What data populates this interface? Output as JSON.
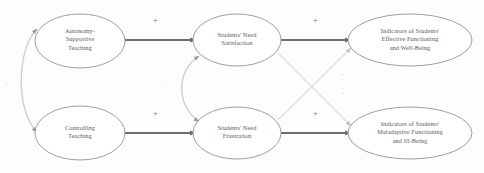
{
  "figure": {
    "type": "path-diagram",
    "background_color": "#fdfdfd",
    "node_stroke_color": "#8d8d8d",
    "node_fill_color": "#ffffff",
    "strong_arrow_color": "#6e6e6e",
    "faint_arrow_color": "#d6d6d6",
    "curved_arrow_color": "#c9c9c9",
    "text_color": "#5a5a5a"
  },
  "nodes": [
    {
      "id": "autonomy-supportive-teaching",
      "label": "Autonomy-\nSupportive\nTeaching",
      "cx": 80,
      "cy": 41,
      "rx": 45,
      "ry": 27
    },
    {
      "id": "controlling-teaching",
      "label": "Controlling\nTeaching",
      "cx": 80,
      "cy": 133,
      "rx": 45,
      "ry": 27
    },
    {
      "id": "students-need-satisfaction",
      "label": "Students' Need\nSatisfaction",
      "cx": 237,
      "cy": 40,
      "rx": 44,
      "ry": 26
    },
    {
      "id": "students-need-frustration",
      "label": "Students' Need\nFrustration",
      "cx": 237,
      "cy": 133,
      "rx": 44,
      "ry": 26
    },
    {
      "id": "indicators-effective-functioning",
      "label": "Indicators of Students'\nEffective Functioning\nand Well-Being",
      "cx": 410,
      "cy": 40,
      "rx": 62,
      "ry": 26
    },
    {
      "id": "indicators-maladaptive-functioning",
      "label": "Indicators of Students'\nMaladaptive Functioning\nand Ill-Being",
      "cx": 410,
      "cy": 133,
      "rx": 62,
      "ry": 26
    }
  ],
  "paths": [
    {
      "id": "autonomy-to-satisfaction",
      "from": "autonomy-supportive-teaching",
      "to": "students-need-satisfaction",
      "sign": "+",
      "style": "strong",
      "sign_x": 153,
      "sign_y": 18
    },
    {
      "id": "controlling-to-frustration",
      "from": "controlling-teaching",
      "to": "students-need-frustration",
      "sign": "+",
      "style": "strong",
      "sign_x": 153,
      "sign_y": 111
    },
    {
      "id": "satisfaction-to-effective",
      "from": "students-need-satisfaction",
      "to": "indicators-effective-functioning",
      "sign": "+",
      "style": "strong",
      "sign_x": 313,
      "sign_y": 18
    },
    {
      "id": "frustration-to-maladaptive",
      "from": "students-need-frustration",
      "to": "indicators-maladaptive-functioning",
      "sign": "+",
      "style": "strong",
      "sign_x": 313,
      "sign_y": 111
    },
    {
      "id": "satisfaction-to-maladaptive",
      "from": "students-need-satisfaction",
      "to": "indicators-maladaptive-functioning",
      "sign": "-",
      "style": "faint-diagonal",
      "sign_x": 341,
      "sign_y": 73
    },
    {
      "id": "frustration-to-effective",
      "from": "students-need-frustration",
      "to": "indicators-effective-functioning",
      "sign": "-",
      "style": "faint-diagonal",
      "sign_x": 342,
      "sign_y": 92
    },
    {
      "id": "teaching-styles-correlation",
      "from": "autonomy-supportive-teaching",
      "to": "controlling-teaching",
      "sign": "-",
      "style": "curved-bidirectional",
      "sign_x": 6,
      "sign_y": 81
    },
    {
      "id": "needs-correlation",
      "from": "students-need-satisfaction",
      "to": "students-need-frustration",
      "sign": "-",
      "style": "curved-bidirectional",
      "sign_x": 161,
      "sign_y": 81
    }
  ]
}
